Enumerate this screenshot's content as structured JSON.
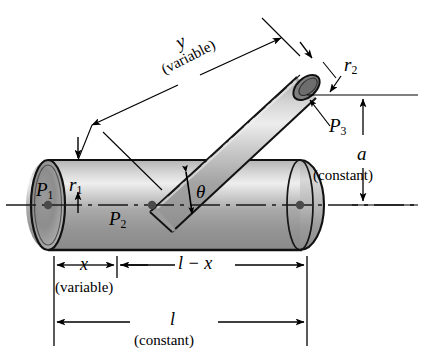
{
  "figure": {
    "name": "branched-pipe-diagram",
    "type": "engineering-line-drawing",
    "background_color": "#ffffff",
    "line_color": "#000000",
    "shading": {
      "highlight": "#e9e9e9",
      "midtone": "#b9b9b9",
      "shadow": "#8e8e8e",
      "end_cap_dark": "#7d7d7d"
    }
  },
  "labels": {
    "p1": "P",
    "p1_sub": "1",
    "p2": "P",
    "p2_sub": "2",
    "p3": "P",
    "p3_sub": "3",
    "r1": "r",
    "r1_sub": "1",
    "r2": "r",
    "r2_sub": "2",
    "theta": "θ",
    "y": "y",
    "y_note": "(variable)",
    "a": "a",
    "a_note": "(constant)",
    "x": "x",
    "x_note": "(variable)",
    "l_minus_x": "l − x",
    "l": "l",
    "l_note": "(constant)"
  },
  "dimensions": [
    {
      "name": "x",
      "label": "x",
      "note": "(variable)",
      "orientation": "horizontal",
      "location": "bottom-left"
    },
    {
      "name": "l-minus-x",
      "label": "l − x",
      "note": "",
      "orientation": "horizontal",
      "location": "bottom-middle"
    },
    {
      "name": "l",
      "label": "l",
      "note": "(constant)",
      "orientation": "horizontal",
      "location": "bottom-full"
    },
    {
      "name": "y",
      "label": "y",
      "note": "(variable)",
      "orientation": "inclined",
      "location": "upper-left-of-branch"
    },
    {
      "name": "a",
      "label": "a",
      "note": "(constant)",
      "orientation": "vertical",
      "location": "right"
    },
    {
      "name": "r1",
      "label": "r1",
      "note": "",
      "orientation": "vertical",
      "location": "left-end-radius"
    },
    {
      "name": "r2",
      "label": "r2",
      "note": "",
      "orientation": "inclined",
      "location": "branch-end-radius"
    },
    {
      "name": "theta",
      "label": "θ",
      "note": "",
      "orientation": "angular",
      "location": "junction"
    }
  ],
  "points": [
    {
      "name": "P1",
      "description": "left end face center of main pipe"
    },
    {
      "name": "P2",
      "description": "junction of branch centerline and main axis"
    },
    {
      "name": "P3",
      "description": "open end center of inclined branch tube"
    }
  ]
}
